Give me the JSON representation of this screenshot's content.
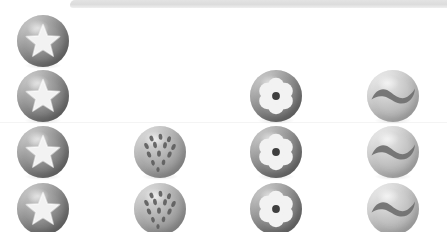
{
  "canvas": {
    "width": 447,
    "height": 232,
    "background": "#ffffff"
  },
  "decor": {
    "top_bar": {
      "name": "top-bar",
      "color": "#dcdcdc",
      "x": 70,
      "y": 0,
      "width": 377,
      "height": 8
    },
    "separator": {
      "name": "separator-line",
      "color": "#f4f4f4",
      "y": 122
    },
    "watermark_text": "                                        "
  },
  "palette": {
    "sphere_dark": "#8d8d8d",
    "sphere_mid": "#ababab",
    "sphere_light": "#c2c2c2",
    "glyph_white": "#f2f2f2",
    "glyph_dark": "#5a5a5a",
    "background": "#ffffff"
  },
  "grid": {
    "columns": 4,
    "rows": 4,
    "sphere_diameter": 52,
    "column_centers": [
      43,
      160,
      276,
      393
    ],
    "row_centers": [
      41,
      96,
      152,
      209
    ],
    "column_icons": [
      "star-icon",
      "dotted-ball-icon",
      "flower-icon",
      "wave-icon"
    ],
    "column_labels": [
      "Star",
      "Dotted Ball",
      "Flower",
      "Wave"
    ]
  },
  "items": [
    {
      "id": "star-r1",
      "icon": "star-icon",
      "label": "Star",
      "tone": "dark",
      "col": 0,
      "row": 0,
      "x": 17,
      "y": 15
    },
    {
      "id": "star-r2",
      "icon": "star-icon",
      "label": "Star",
      "tone": "dark",
      "col": 0,
      "row": 1,
      "x": 17,
      "y": 70
    },
    {
      "id": "star-r3",
      "icon": "star-icon",
      "label": "Star",
      "tone": "dark",
      "col": 0,
      "row": 2,
      "x": 17,
      "y": 126
    },
    {
      "id": "star-r4",
      "icon": "star-icon",
      "label": "Star",
      "tone": "dark",
      "col": 0,
      "row": 3,
      "x": 17,
      "y": 183
    },
    {
      "id": "dots-r3",
      "icon": "dotted-ball-icon",
      "label": "Dotted Ball",
      "tone": "mid",
      "col": 1,
      "row": 2,
      "x": 134,
      "y": 126
    },
    {
      "id": "dots-r4",
      "icon": "dotted-ball-icon",
      "label": "Dotted Ball",
      "tone": "mid",
      "col": 1,
      "row": 3,
      "x": 134,
      "y": 183
    },
    {
      "id": "flower-r2",
      "icon": "flower-icon",
      "label": "Flower",
      "tone": "dark",
      "col": 2,
      "row": 1,
      "x": 250,
      "y": 70
    },
    {
      "id": "flower-r3",
      "icon": "flower-icon",
      "label": "Flower",
      "tone": "dark",
      "col": 2,
      "row": 2,
      "x": 250,
      "y": 126
    },
    {
      "id": "flower-r4",
      "icon": "flower-icon",
      "label": "Flower",
      "tone": "dark",
      "col": 2,
      "row": 3,
      "x": 250,
      "y": 183
    },
    {
      "id": "wave-r2",
      "icon": "wave-icon",
      "label": "Wave",
      "tone": "light",
      "col": 3,
      "row": 1,
      "x": 367,
      "y": 70
    },
    {
      "id": "wave-r3",
      "icon": "wave-icon",
      "label": "Wave",
      "tone": "light",
      "col": 3,
      "row": 2,
      "x": 367,
      "y": 126
    },
    {
      "id": "wave-r4",
      "icon": "wave-icon",
      "label": "Wave",
      "tone": "light",
      "col": 3,
      "row": 3,
      "x": 367,
      "y": 183
    }
  ]
}
